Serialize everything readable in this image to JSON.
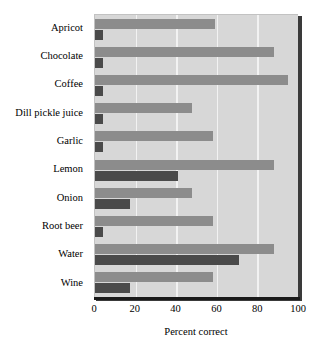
{
  "chart_data": {
    "type": "bar",
    "orientation": "horizontal",
    "title": "",
    "subtitle": "",
    "xlabel": "Percent correct",
    "ylabel": "",
    "xlim": [
      0,
      100
    ],
    "xticks": [
      0,
      20,
      40,
      60,
      80,
      100
    ],
    "xtick_labels": [
      "0",
      "20",
      "40",
      "60",
      "80",
      "100"
    ],
    "grid": true,
    "grid_axis": "x",
    "legend": false,
    "legend_position": "none",
    "categories": [
      "Apricot",
      "Chocolate",
      "Coffee",
      "Dill pickle juice",
      "Garlic",
      "Lemon",
      "Onion",
      "Root beer",
      "Water",
      "Wine"
    ],
    "series": [
      {
        "name": "primary",
        "color": "#8c8c8c",
        "values": [
          59,
          88,
          95,
          48,
          58,
          88,
          48,
          58,
          88,
          58
        ]
      },
      {
        "name": "secondary",
        "color": "#4a4a4a",
        "values": [
          4,
          4,
          4,
          4,
          4,
          41,
          17,
          4,
          71,
          17
        ]
      }
    ],
    "colors": {
      "plot_background": "#d7d7d7",
      "gridline": "#f2f2f2",
      "axis": "#1a1a1a",
      "primary_bar": "#8c8c8c",
      "secondary_bar": "#4a4a4a",
      "text": "#000000"
    }
  }
}
